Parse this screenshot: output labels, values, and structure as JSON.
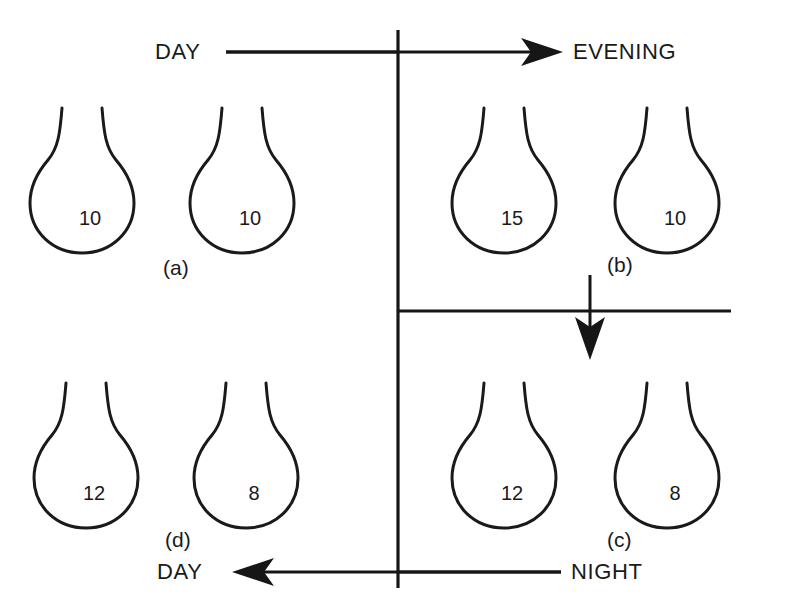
{
  "diagram": {
    "type": "cycle-diagram",
    "background_color": "#ffffff",
    "line_color": "#1a1a1a",
    "direction_labels": {
      "top_left": "DAY",
      "top_right": "EVENING",
      "bottom_right": "NIGHT",
      "bottom_left": "DAY"
    },
    "stages": [
      {
        "id": "a",
        "label": "(a)",
        "quadrant": "top-left",
        "flasks": [
          {
            "value": "10"
          },
          {
            "value": "10"
          }
        ]
      },
      {
        "id": "b",
        "label": "(b)",
        "quadrant": "top-right",
        "flasks": [
          {
            "value": "15"
          },
          {
            "value": "10"
          }
        ]
      },
      {
        "id": "c",
        "label": "(c)",
        "quadrant": "bottom-right",
        "flasks": [
          {
            "value": "12"
          },
          {
            "value": "8"
          }
        ]
      },
      {
        "id": "d",
        "label": "(d)",
        "quadrant": "bottom-left",
        "flasks": [
          {
            "value": "12"
          },
          {
            "value": "8"
          }
        ]
      }
    ],
    "arrows": [
      {
        "id": "top-arrow",
        "from": "DAY",
        "to": "EVENING",
        "direction": "right"
      },
      {
        "id": "middle-arrow",
        "from": "(b)",
        "to": "(c)",
        "direction": "down"
      },
      {
        "id": "bottom-arrow",
        "from": "NIGHT",
        "to": "DAY",
        "direction": "left"
      }
    ]
  }
}
